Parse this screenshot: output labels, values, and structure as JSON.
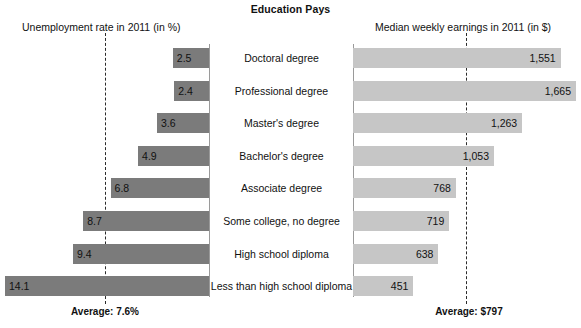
{
  "chart_data": {
    "type": "bar",
    "title": "Education Pays",
    "orientation": "horizontal-diverging",
    "categories": [
      "Doctoral degree",
      "Professional degree",
      "Master's degree",
      "Bachelor's degree",
      "Associate degree",
      "Some college, no degree",
      "High school diploma",
      "Less than high school diploma"
    ],
    "series": [
      {
        "name": "Unemployment rate in 2011 (in %)",
        "side": "left",
        "unit": "%",
        "color": "#7b7b7b",
        "axis_max": 14.1,
        "values": [
          2.5,
          2.4,
          3.6,
          4.9,
          6.8,
          8.7,
          9.4,
          14.1
        ],
        "labels": [
          "2.5",
          "2.4",
          "3.6",
          "4.9",
          "6.8",
          "8.7",
          "9.4",
          "14.1"
        ],
        "average": 7.6,
        "average_label": "Average: 7.6%"
      },
      {
        "name": "Median weekly earnings in 2011 (in $)",
        "side": "right",
        "unit": "$",
        "color": "#c6c6c6",
        "axis_max": 1665,
        "values": [
          1551,
          1665,
          1263,
          1053,
          768,
          719,
          638,
          451
        ],
        "labels": [
          "1,551",
          "1,665",
          "1,263",
          "1,053",
          "768",
          "719",
          "638",
          "451"
        ],
        "average": 797,
        "average_label": "Average: $797"
      }
    ],
    "xlabel": "",
    "ylabel": "",
    "grid": false,
    "legend": "none"
  },
  "header": {
    "title": "Education Pays",
    "subtitle_left": "Unemployment rate in 2011 (in %)",
    "subtitle_right": "Median weekly earnings in 2011 (in $)"
  },
  "rows": [
    {
      "label": "Doctoral degree",
      "left_value": "2.5",
      "right_value": "1,551"
    },
    {
      "label": "Professional degree",
      "left_value": "2.4",
      "right_value": "1,665"
    },
    {
      "label": "Master's degree",
      "left_value": "3.6",
      "right_value": "1,263"
    },
    {
      "label": "Bachelor's degree",
      "left_value": "4.9",
      "right_value": "1,053"
    },
    {
      "label": "Associate degree",
      "left_value": "6.8",
      "right_value": "768"
    },
    {
      "label": "Some college, no degree",
      "left_value": "8.7",
      "right_value": "719"
    },
    {
      "label": "High school diploma",
      "left_value": "9.4",
      "right_value": "638"
    },
    {
      "label": "Less than high school diploma",
      "left_value": "14.1",
      "right_value": "451"
    }
  ],
  "footer": {
    "average_left": "Average: 7.6%",
    "average_right": "Average: $797"
  },
  "colors": {
    "bar_left": "#7b7b7b",
    "bar_right": "#c6c6c6",
    "axis": "#9a9a9a",
    "dashed": "#2b2b2b",
    "text": "#111111"
  }
}
